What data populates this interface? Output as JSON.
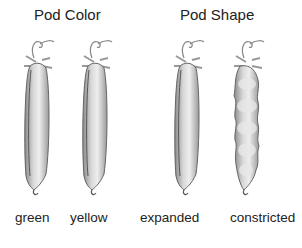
{
  "headings": {
    "pod_color": "Pod Color",
    "pod_shape": "Pod Shape"
  },
  "pods": [
    {
      "label": "green",
      "group": "Pod Color",
      "shape": "smooth"
    },
    {
      "label": "yellow",
      "group": "Pod Color",
      "shape": "smooth"
    },
    {
      "label": "expanded",
      "group": "Pod Shape",
      "shape": "smooth"
    },
    {
      "label": "constricted",
      "group": "Pod Shape",
      "shape": "constricted"
    }
  ]
}
